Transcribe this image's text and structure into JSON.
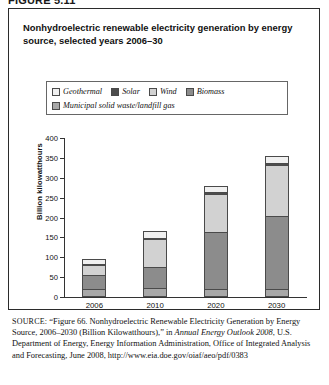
{
  "figure_number": "FIGURE 5.11",
  "figure_title": "Nonhydroelectric renewable electricity generation by energy source, selected years 2006–30",
  "legend": {
    "items": [
      {
        "label": "Geothermal",
        "color": "#f0f0f0",
        "swatch_name": "legend-swatch-geothermal"
      },
      {
        "label": "Solar",
        "color": "#4d4d4d",
        "swatch_name": "legend-swatch-solar"
      },
      {
        "label": "Wind",
        "color": "#d2d2d2",
        "swatch_name": "legend-swatch-wind"
      },
      {
        "label": "Biomass",
        "color": "#8c8c8c",
        "swatch_name": "legend-swatch-biomass"
      },
      {
        "label": "Municipal solid waste/landfill gas",
        "color": "#a8a8a8",
        "swatch_name": "legend-swatch-msw"
      }
    ]
  },
  "source_note": {
    "prefix": "SOURCE:",
    "text_1": " “Figure 66. Nonhydroelectric Renewable Electricity Generation by Energy Source, 2006–2030 (Billion Kilowatthours),” in ",
    "italic_1": "Annual Energy Outlook 2008",
    "text_2": ", U.S. Department of Energy, Energy Information Administration, Office of Integrated Analysis and Forecasting, June 2008, http://www.eia.doe.gov/oiaf/aeo/pdf/0383"
  },
  "chart_data": {
    "type": "bar",
    "stacked": true,
    "title": "Nonhydroelectric renewable electricity generation by energy source, selected years 2006–30",
    "xlabel": "",
    "ylabel": "Billion kilowatthours",
    "categories": [
      "2006",
      "2010",
      "2020",
      "2030"
    ],
    "ylim": [
      0,
      400
    ],
    "yticks": [
      0,
      50,
      100,
      150,
      200,
      250,
      300,
      350,
      400
    ],
    "grid": false,
    "legend_position": "top",
    "units": "Billion kilowatthours",
    "series": [
      {
        "name": "Municipal solid waste/landfill gas",
        "color": "#a8a8a8",
        "values": [
          15,
          18,
          16,
          16
        ]
      },
      {
        "name": "Biomass",
        "color": "#8c8c8c",
        "values": [
          40,
          55,
          145,
          185
        ]
      },
      {
        "name": "Wind",
        "color": "#d2d2d2",
        "values": [
          25,
          72,
          98,
          130
        ]
      },
      {
        "name": "Solar",
        "color": "#4d4d4d",
        "values": [
          1,
          3,
          4,
          5
        ]
      },
      {
        "name": "Geothermal",
        "color": "#f0f0f0",
        "values": [
          15,
          17,
          17,
          19
        ]
      }
    ],
    "totals": [
      96,
      165,
      280,
      355
    ]
  }
}
